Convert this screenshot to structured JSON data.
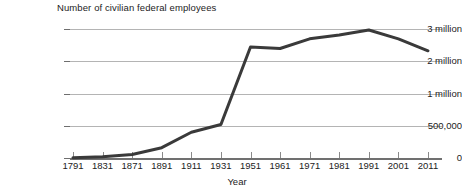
{
  "chart_data": {
    "type": "line",
    "title": "Number of civilian federal employees",
    "xlabel": "Year",
    "ylabel": "",
    "grid": true,
    "legend": "none",
    "line_color": "#3a3a3a",
    "grid_color": "#b4b4b4",
    "axis_color": "#707070",
    "background": "#ffffff",
    "y_axis_note": "non-linear: 500,000 occupies one full interval equal to each 1 million step",
    "y_ticks": [
      {
        "label": "3 million",
        "value": 3000000
      },
      {
        "label": "2 million",
        "value": 2000000
      },
      {
        "label": "1 million",
        "value": 1000000
      },
      {
        "label": "500,000",
        "value": 500000
      },
      {
        "label": "0",
        "value": 0
      }
    ],
    "categories": [
      "1791",
      "1831",
      "1871",
      "1891",
      "1911",
      "1931",
      "1951",
      "1961",
      "1971",
      "1981",
      "1991",
      "2001",
      "2011"
    ],
    "values": [
      5000,
      20000,
      55000,
      160000,
      400000,
      520000,
      2450000,
      2400000,
      2700000,
      2820000,
      2975000,
      2700000,
      2330000
    ],
    "series": [
      {
        "name": "Number of civilian federal employees",
        "points": [
          {
            "x": "1791",
            "y": 5000
          },
          {
            "x": "1831",
            "y": 20000
          },
          {
            "x": "1871",
            "y": 55000
          },
          {
            "x": "1891",
            "y": 160000
          },
          {
            "x": "1911",
            "y": 400000
          },
          {
            "x": "1931",
            "y": 520000
          },
          {
            "x": "1951",
            "y": 2450000
          },
          {
            "x": "1961",
            "y": 2400000
          },
          {
            "x": "1971",
            "y": 2700000
          },
          {
            "x": "1981",
            "y": 2820000
          },
          {
            "x": "1991",
            "y": 2975000
          },
          {
            "x": "2001",
            "y": 2700000
          },
          {
            "x": "2011",
            "y": 2330000
          }
        ]
      }
    ]
  }
}
